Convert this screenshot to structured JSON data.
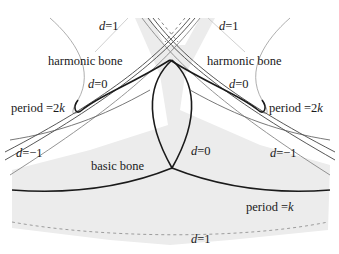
{
  "diagram": {
    "type": "bone-curves-diagram",
    "colors": {
      "shade": "#ebebeb",
      "thick": "#1a1a1a",
      "thin": "#8a8a8a",
      "dashed": "#888888",
      "text": "#1a1a1a"
    },
    "labels": {
      "d1_top_left": {
        "var": "d",
        "rest": "=1"
      },
      "d1_top_right": {
        "var": "d",
        "rest": "=1"
      },
      "harmonic_left": "harmonic bone",
      "harmonic_right": "harmonic bone",
      "d0_left": {
        "var": "d",
        "rest": "=0"
      },
      "d0_right": {
        "var": "d",
        "rest": "=0"
      },
      "period2k_left": {
        "text": "period =2",
        "var": "k"
      },
      "period2k_right": {
        "text": "period =2",
        "var": "k"
      },
      "dm1_left": {
        "var": "d",
        "rest": "=−1"
      },
      "dm1_right": {
        "var": "d",
        "rest": "=−1"
      },
      "basic": "basic bone",
      "d0_center": {
        "var": "d",
        "rest": "=0"
      },
      "periodk": {
        "text": "period =",
        "var": "k"
      },
      "d1_bottom": {
        "var": "d",
        "rest": "=1"
      }
    }
  }
}
